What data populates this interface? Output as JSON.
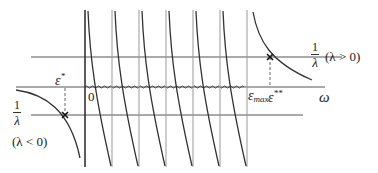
{
  "diagram": {
    "title": "",
    "labels": {
      "epsilon_star": "ε",
      "epsilon_star_sup": "*",
      "epsilon_double_star": "ε",
      "epsilon_double_star_sup": "**",
      "epsilon_max": "ε",
      "epsilon_max_sub": "max",
      "origin": "0",
      "omega": "ω",
      "one_over_lambda_num": "1",
      "one_over_lambda_den": "λ",
      "lambda_positive": "(λ > 0)",
      "lambda_negative": "(λ < 0)"
    },
    "colors": {
      "line": "#333333",
      "grid": "#888888",
      "curve": "#333333",
      "dashed": "#666666"
    },
    "vertical_lines_x": [
      85,
      112,
      139,
      166,
      193,
      220,
      247
    ],
    "horizontal_lines": {
      "upper_one_over_lambda_y": 57,
      "omega_axis_y": 87,
      "lower_one_over_lambda_y": 115
    },
    "intersections": [
      {
        "name": "epsilon-double-star",
        "x": 270,
        "y": 57
      },
      {
        "name": "epsilon-star",
        "x": 65,
        "y": 115
      }
    ]
  }
}
